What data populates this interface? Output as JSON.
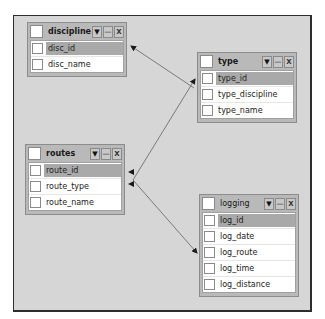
{
  "diagram": {
    "type": "database-schema",
    "colors": {
      "canvas": "#d6d6d6",
      "frame_border": "#2e2e2e",
      "table_body": "#b9b9b9",
      "selected_row": "#a9a9a9",
      "link_line": "#7a7a7a",
      "arrowhead": "#1a1a1a"
    },
    "header_buttons": {
      "dropdown": "▼",
      "minimize": "—",
      "close": "X"
    },
    "tables": [
      {
        "name": "discipline",
        "fields": [
          {
            "name": "disc_id",
            "selected": true
          },
          {
            "name": "disc_name",
            "selected": false
          }
        ]
      },
      {
        "name": "type",
        "fields": [
          {
            "name": "type_id",
            "selected": true
          },
          {
            "name": "type_discipline",
            "selected": false
          },
          {
            "name": "type_name",
            "selected": false
          }
        ]
      },
      {
        "name": "routes",
        "fields": [
          {
            "name": "route_id",
            "selected": true
          },
          {
            "name": "route_type",
            "selected": false
          },
          {
            "name": "route_name",
            "selected": false
          }
        ]
      },
      {
        "name": "logging",
        "fields": [
          {
            "name": "log_id",
            "selected": true
          },
          {
            "name": "log_date",
            "selected": false
          },
          {
            "name": "log_route",
            "selected": false
          },
          {
            "name": "log_time",
            "selected": false
          },
          {
            "name": "log_distance",
            "selected": false
          }
        ]
      }
    ],
    "relationships": [
      {
        "from": "type.type_discipline",
        "to": "discipline.disc_id"
      },
      {
        "from": "routes.route_type",
        "to": "type.type_id"
      },
      {
        "from": "logging.log_route",
        "to": "routes.route_id"
      }
    ]
  }
}
